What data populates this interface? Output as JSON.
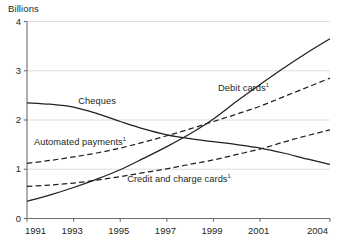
{
  "axis": {
    "unit_label": "Billions",
    "y_ticks": [
      "4",
      "3",
      "2",
      "1",
      "0"
    ],
    "x_ticks": [
      "1991",
      "1993",
      "1995",
      "1997",
      "1999",
      "2001",
      "2004"
    ]
  },
  "labels": {
    "cheques": "Cheques",
    "debit_cards": "Debit cards",
    "debit_cards_note": "1",
    "automated_payments": "Automated payments",
    "automated_payments_note": "1",
    "credit_charge_cards": "Credit and charge cards",
    "credit_charge_cards_note": "1"
  },
  "colors": {
    "line": "#231f20",
    "grid": "#d9d9d9",
    "axis": "#6d6e71",
    "background": "#ffffff"
  },
  "chart_data": {
    "type": "line",
    "title": "",
    "subtitle": "",
    "xlabel": "",
    "ylabel": "Billions",
    "xlim": [
      1991,
      2004
    ],
    "ylim": [
      0,
      4
    ],
    "grid": true,
    "legend_position": "inline-annotations",
    "x": [
      1991,
      1992,
      1993,
      1994,
      1995,
      1996,
      1997,
      1998,
      1999,
      2000,
      2001,
      2002,
      2003,
      2004
    ],
    "x_tick_labels": [
      "1991",
      "1993",
      "1995",
      "1997",
      "1999",
      "2001",
      "2004"
    ],
    "y_tick_labels": [
      "0",
      "1",
      "2",
      "3",
      "4"
    ],
    "series": [
      {
        "name": "Cheques",
        "style": "solid",
        "label_x": 1993.2,
        "label_y": 2.34,
        "values": [
          2.35,
          2.32,
          2.26,
          2.13,
          1.97,
          1.82,
          1.7,
          1.62,
          1.56,
          1.5,
          1.43,
          1.33,
          1.21,
          1.1
        ]
      },
      {
        "name": "Debit cards",
        "style": "solid",
        "label_x": 1999.2,
        "label_y": 2.62,
        "values": [
          0.35,
          0.48,
          0.63,
          0.8,
          0.99,
          1.22,
          1.46,
          1.72,
          2.02,
          2.38,
          2.72,
          3.05,
          3.36,
          3.65
        ]
      },
      {
        "name": "Automated payments",
        "style": "dashed",
        "label_x": 1991.3,
        "label_y": 1.52,
        "values": [
          1.12,
          1.18,
          1.25,
          1.33,
          1.43,
          1.55,
          1.68,
          1.82,
          1.97,
          2.12,
          2.28,
          2.47,
          2.66,
          2.85
        ]
      },
      {
        "name": "Credit and charge cards",
        "style": "dashed",
        "label_x": 1995.3,
        "label_y": 0.77,
        "values": [
          0.65,
          0.68,
          0.72,
          0.78,
          0.85,
          0.93,
          1.01,
          1.1,
          1.19,
          1.3,
          1.41,
          1.55,
          1.68,
          1.8
        ]
      }
    ]
  }
}
